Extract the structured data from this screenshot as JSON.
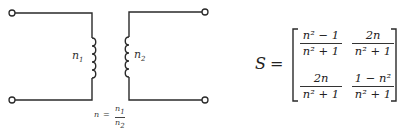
{
  "diagram": {
    "type": "ideal-transformer",
    "primary_label": "n1",
    "secondary_label": "n2",
    "ratio_label": {
      "lhs": "n",
      "equals": "=",
      "numerator": "n1",
      "denominator": "n2"
    },
    "terminals": 4,
    "line_color": "#2a2a2a"
  },
  "matrix": {
    "symbol": "S",
    "equals": "=",
    "cells": [
      [
        {
          "numerator": "n² − 1",
          "denominator": "n² + 1"
        },
        {
          "numerator": "2n",
          "denominator": "n² + 1"
        }
      ],
      [
        {
          "numerator": "2n",
          "denominator": "n² + 1"
        },
        {
          "numerator": "1 − n²",
          "denominator": "n² + 1"
        }
      ]
    ]
  }
}
